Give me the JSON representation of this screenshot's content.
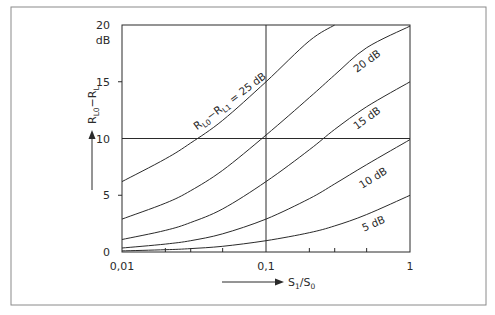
{
  "chart_data": {
    "type": "line",
    "title": "",
    "xlabel": "S1/S0",
    "xlabel_main": "S",
    "xlabel_sub1": "1",
    "xlabel_mid": "/S",
    "xlabel_sub2": "0",
    "ylabel": "RL0-RL",
    "ylabel_parts": [
      "R",
      "L0",
      "−R",
      "L"
    ],
    "y_unit": "dB",
    "xscale": "log",
    "xlim": [
      0.01,
      1
    ],
    "ylim": [
      0,
      20
    ],
    "x_ticks": [
      {
        "value": 0.01,
        "label": "0,01"
      },
      {
        "value": 0.1,
        "label": "0,1"
      },
      {
        "value": 1,
        "label": "1"
      }
    ],
    "y_ticks": [
      {
        "value": 0,
        "label": "0"
      },
      {
        "value": 5,
        "label": "5"
      },
      {
        "value": 10,
        "label": "10"
      },
      {
        "value": 15,
        "label": "15"
      },
      {
        "value": 20,
        "label": "20"
      }
    ],
    "grid": {
      "vertical_at": [
        0.1
      ],
      "horizontal_at": [
        10
      ]
    },
    "series": [
      {
        "name": "RL0−RL1 = 25 dB",
        "label": "R_L0−R_L1 = 25 dB",
        "x": [
          0.01,
          0.02,
          0.03,
          0.05,
          0.1,
          0.2,
          0.3
        ],
        "y": [
          6.2,
          8.2,
          9.6,
          11.6,
          15.0,
          18.6,
          20.0
        ]
      },
      {
        "name": "20 dB",
        "label": "20 dB",
        "x": [
          0.01,
          0.02,
          0.03,
          0.05,
          0.1,
          0.2,
          0.3,
          0.5,
          1
        ],
        "y": [
          2.9,
          4.3,
          5.4,
          7.2,
          10.3,
          13.6,
          15.6,
          18.0,
          19.9
        ]
      },
      {
        "name": "15 dB",
        "label": "15 dB",
        "x": [
          0.01,
          0.02,
          0.03,
          0.05,
          0.1,
          0.2,
          0.3,
          0.5,
          1
        ],
        "y": [
          1.1,
          1.9,
          2.6,
          3.8,
          6.2,
          9.0,
          10.8,
          12.8,
          15.0
        ]
      },
      {
        "name": "10 dB",
        "label": "10 dB",
        "x": [
          0.01,
          0.02,
          0.03,
          0.05,
          0.1,
          0.2,
          0.3,
          0.5,
          1
        ],
        "y": [
          0.35,
          0.7,
          1.0,
          1.6,
          2.9,
          4.7,
          6.0,
          7.7,
          9.9
        ]
      },
      {
        "name": "5 dB",
        "label": "5 dB",
        "x": [
          0.01,
          0.02,
          0.03,
          0.05,
          0.1,
          0.2,
          0.3,
          0.5,
          1
        ],
        "y": [
          0.1,
          0.2,
          0.3,
          0.5,
          1.0,
          1.7,
          2.3,
          3.3,
          5.0
        ]
      }
    ],
    "minor_x_ticks": [
      0.02,
      0.03,
      0.05,
      0.2,
      0.3,
      0.5
    ],
    "legend": "inline labels along curves"
  },
  "layout": {
    "frame": {
      "x": 11,
      "y": 7,
      "w": 475,
      "h": 298
    },
    "plot": {
      "x": 122,
      "y": 25,
      "w": 288,
      "h": 227
    },
    "line_color": "#2a2a2a",
    "frame_color": "#8a8a8a"
  },
  "labels": [
    {
      "series": 0,
      "text_main": "R",
      "sub1": "L0",
      "mid": "−R",
      "sub2": "L1",
      "tail": " = 25 dB",
      "x": 232,
      "y": 104,
      "angle": -37
    },
    {
      "series": 1,
      "text": "20 dB",
      "x": 369,
      "y": 64,
      "angle": -36
    },
    {
      "series": 2,
      "text": "15 dB",
      "x": 369,
      "y": 121,
      "angle": -36
    },
    {
      "series": 3,
      "text": "10 dB",
      "x": 375,
      "y": 181,
      "angle": -32
    },
    {
      "series": 4,
      "text": "5 dB",
      "x": 375,
      "y": 227,
      "angle": -24
    }
  ]
}
